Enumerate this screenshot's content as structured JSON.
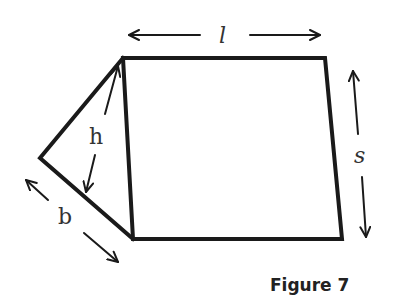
{
  "figure": {
    "caption": "Figure 7",
    "labels": {
      "length": "l",
      "height": "h",
      "side": "s",
      "base": "b"
    },
    "shapes": {
      "quadrilateral": {
        "name": "rectangle face",
        "vertices": [
          [
            123,
            58
          ],
          [
            325,
            58
          ],
          [
            342,
            239
          ],
          [
            133,
            239
          ]
        ]
      },
      "triangle": {
        "name": "triangular face",
        "vertices": [
          [
            123,
            58
          ],
          [
            40,
            158
          ],
          [
            133,
            239
          ]
        ]
      }
    },
    "dimensions": [
      {
        "label": "l",
        "description": "double arrow along top edge"
      },
      {
        "label": "s",
        "description": "double arrow along right edge"
      },
      {
        "label": "h",
        "description": "height arrow from triangle top vertex to base"
      },
      {
        "label": "b",
        "description": "double arrow along triangle base"
      }
    ]
  }
}
